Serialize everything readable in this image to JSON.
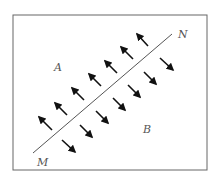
{
  "diagram": {
    "frame": {
      "x": 13,
      "y": 15,
      "width": 194,
      "height": 155,
      "stroke": "#666666"
    },
    "line": {
      "start_label": "M",
      "end_label": "N",
      "x1": 33,
      "y1": 153,
      "x2": 172,
      "y2": 34,
      "color": "#555555"
    },
    "regions": [
      {
        "label": "A",
        "x": 54,
        "y": 71
      },
      {
        "label": "B",
        "x": 143,
        "y": 133
      }
    ],
    "labels": {
      "M": {
        "text": "M",
        "x": 37,
        "y": 166
      },
      "N": {
        "text": "N",
        "x": 178,
        "y": 38
      }
    },
    "arrow_color": "#111111",
    "arrows_region_A_direction": "up-left (away from line MN)",
    "arrows_region_B_direction": "down-right (away from line MN)",
    "arrows_A": [
      {
        "x1": 52,
        "y1": 130,
        "x2": 39,
        "y2": 117
      },
      {
        "x1": 67,
        "y1": 115,
        "x2": 55,
        "y2": 103
      },
      {
        "x1": 84,
        "y1": 100,
        "x2": 72,
        "y2": 88
      },
      {
        "x1": 101,
        "y1": 86,
        "x2": 89,
        "y2": 74
      },
      {
        "x1": 117,
        "y1": 73,
        "x2": 105,
        "y2": 61
      },
      {
        "x1": 133,
        "y1": 59,
        "x2": 121,
        "y2": 47
      },
      {
        "x1": 148,
        "y1": 46,
        "x2": 137,
        "y2": 34
      }
    ],
    "arrows_B": [
      {
        "x1": 62,
        "y1": 140,
        "x2": 75,
        "y2": 152
      },
      {
        "x1": 80,
        "y1": 125,
        "x2": 92,
        "y2": 137
      },
      {
        "x1": 96,
        "y1": 111,
        "x2": 108,
        "y2": 123
      },
      {
        "x1": 113,
        "y1": 98,
        "x2": 125,
        "y2": 110
      },
      {
        "x1": 128,
        "y1": 85,
        "x2": 140,
        "y2": 97
      },
      {
        "x1": 144,
        "y1": 72,
        "x2": 156,
        "y2": 84
      },
      {
        "x1": 160,
        "y1": 58,
        "x2": 173,
        "y2": 70
      }
    ]
  }
}
